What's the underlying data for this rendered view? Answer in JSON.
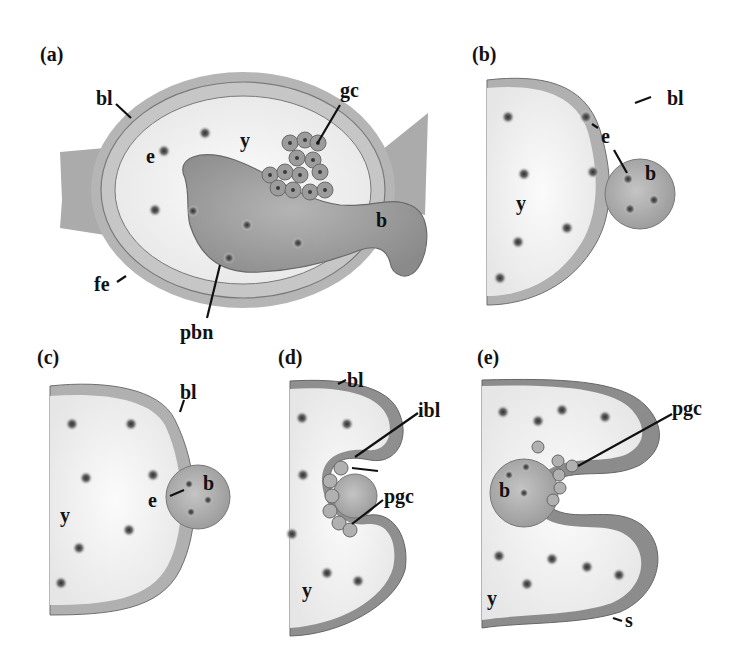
{
  "figure": {
    "type": "schematic",
    "colors": {
      "background": "#ffffff",
      "yolk": "#f2f2f2",
      "cell_fill": "#a8a8a8",
      "cell_border": "#6f6f6f",
      "nucleus": "#3a3a3a",
      "pbn_blob": "#9a9a9a",
      "follicle": "#b8b8b8",
      "leader_line": "#111111"
    }
  },
  "panels": [
    {
      "id": "a",
      "label": "(a)",
      "annotations": [
        {
          "key": "bl",
          "text": "bl"
        },
        {
          "key": "gc",
          "text": "gc"
        },
        {
          "key": "e",
          "text": "e"
        },
        {
          "key": "y",
          "text": "y"
        },
        {
          "key": "b",
          "text": "b"
        },
        {
          "key": "fe",
          "text": "fe"
        },
        {
          "key": "pbn",
          "text": "pbn"
        }
      ]
    },
    {
      "id": "b",
      "label": "(b)",
      "annotations": [
        {
          "key": "bl",
          "text": "bl"
        },
        {
          "key": "e",
          "text": "e"
        },
        {
          "key": "b",
          "text": "b"
        },
        {
          "key": "y",
          "text": "y"
        }
      ]
    },
    {
      "id": "c",
      "label": "(c)",
      "annotations": [
        {
          "key": "bl",
          "text": "bl"
        },
        {
          "key": "e",
          "text": "e"
        },
        {
          "key": "b",
          "text": "b"
        },
        {
          "key": "y",
          "text": "y"
        }
      ]
    },
    {
      "id": "d",
      "label": "(d)",
      "annotations": [
        {
          "key": "bl",
          "text": "bl"
        },
        {
          "key": "ibl",
          "text": "ibl"
        },
        {
          "key": "pgc",
          "text": "pgc"
        },
        {
          "key": "y",
          "text": "y"
        }
      ]
    },
    {
      "id": "e",
      "label": "(e)",
      "annotations": [
        {
          "key": "pgc",
          "text": "pgc"
        },
        {
          "key": "b",
          "text": "b"
        },
        {
          "key": "y",
          "text": "y"
        },
        {
          "key": "s",
          "text": "s"
        }
      ]
    }
  ]
}
